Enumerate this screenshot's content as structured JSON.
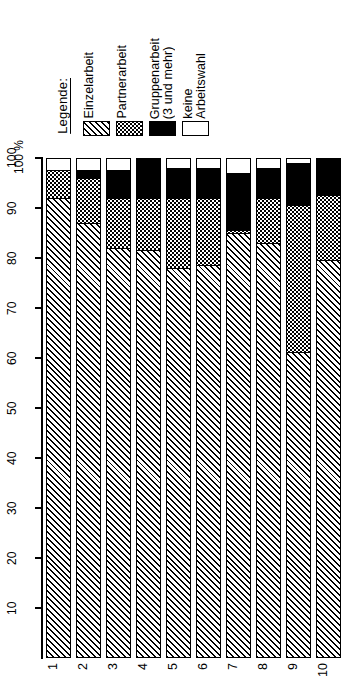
{
  "legend": {
    "title": "Legende:",
    "entries": [
      {
        "label": "Einzelarbeit",
        "fill": "hatch"
      },
      {
        "label": "Partnerarbeit",
        "fill": "dots"
      },
      {
        "label": "Gruppenarbeit\n(3 und mehr)",
        "fill": "black"
      },
      {
        "label": "keine\nArbeitswahl",
        "fill": "white"
      }
    ]
  },
  "axis": {
    "unit": "100 %",
    "ticks": [
      "100",
      "90",
      "80",
      "70",
      "60",
      "50",
      "40",
      "30",
      "20",
      "10"
    ]
  },
  "chart_data": {
    "type": "bar",
    "title": "",
    "xlabel": "",
    "ylabel": "100 %",
    "ylim": [
      0,
      100
    ],
    "grid": false,
    "stacked": true,
    "orientation": "vertical",
    "legend_position": "top-left",
    "categories": [
      "1",
      "2",
      "3",
      "4",
      "5",
      "6",
      "7",
      "8",
      "9",
      "10"
    ],
    "series": [
      {
        "name": "Einzelarbeit",
        "fill": "hatch",
        "values": [
          92,
          87,
          82,
          81.5,
          78,
          78.5,
          85,
          83,
          61,
          79.5
        ]
      },
      {
        "name": "Partnerarbeit",
        "fill": "dots",
        "values": [
          5.5,
          9,
          10,
          10.5,
          14,
          13.5,
          0.5,
          9,
          29.5,
          13
        ]
      },
      {
        "name": "Gruppenarbeit (3 und mehr)",
        "fill": "black",
        "values": [
          0,
          1.5,
          5.5,
          8,
          6,
          6,
          11.5,
          6,
          8.5,
          7.5
        ]
      },
      {
        "name": "keine Arbeitswahl",
        "fill": "white",
        "values": [
          2.5,
          2.5,
          2.5,
          0,
          2,
          2,
          3,
          2,
          1,
          0
        ]
      }
    ]
  }
}
